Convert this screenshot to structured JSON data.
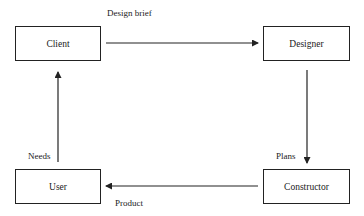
{
  "diagram": {
    "nodes": [
      {
        "id": "client",
        "label": "Client"
      },
      {
        "id": "designer",
        "label": "Designer"
      },
      {
        "id": "constructor",
        "label": "Constructor"
      },
      {
        "id": "user",
        "label": "User"
      }
    ],
    "edges": [
      {
        "from": "client",
        "to": "designer",
        "label": "Design brief"
      },
      {
        "from": "designer",
        "to": "constructor",
        "label": "Plans"
      },
      {
        "from": "constructor",
        "to": "user",
        "label": "Product"
      },
      {
        "from": "user",
        "to": "client",
        "label": "Needs"
      }
    ],
    "colors": {
      "stroke": "#222222",
      "background": "#ffffff"
    }
  }
}
